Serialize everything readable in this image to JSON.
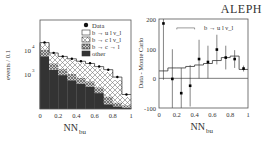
{
  "header": {
    "experiment_label": "ALEPH"
  },
  "chart_data": [
    {
      "type": "bar",
      "subtype": "stacked-histogram-log",
      "title": "",
      "xlabel": "NN_bu",
      "xlabel_main": "NN",
      "xlabel_sub": "bu",
      "ylabel": "events / 0.1",
      "yscale": "log",
      "xlim": [
        0,
        1
      ],
      "ylim": [
        35,
        180000
      ],
      "x_ticks": [
        "0",
        "0.2",
        "0.4",
        "0.6",
        "0.8",
        "1"
      ],
      "y_ticks": [
        {
          "label": "10",
          "exp": "4",
          "value": 10000
        },
        {
          "label": "10",
          "exp": "3",
          "value": 1000
        }
      ],
      "categories": [
        "0.0-0.1",
        "0.1-0.2",
        "0.2-0.3",
        "0.3-0.4",
        "0.4-0.5",
        "0.5-0.6",
        "0.6-0.7",
        "0.7-0.8",
        "0.8-0.9",
        "0.9-1.0"
      ],
      "series": [
        {
          "name": "other",
          "pattern": "solid-dark",
          "values": [
            5500,
            1500,
            900,
            550,
            400,
            300,
            160,
            55,
            45,
            40
          ]
        },
        {
          "name": "b → c → l",
          "pattern": "dense-crosshatch",
          "values": [
            5000,
            1300,
            700,
            450,
            300,
            200,
            120,
            60,
            20,
            10
          ]
        },
        {
          "name": "b → c l ν_l",
          "pattern": "crosshatch",
          "values": [
            8500,
            4200,
            3300,
            2900,
            2300,
            1900,
            1450,
            1100,
            500,
            60
          ]
        },
        {
          "name": "b → u l ν_l",
          "pattern": "white",
          "values": [
            1500,
            500,
            500,
            400,
            400,
            350,
            300,
            300,
            180,
            30
          ]
        }
      ],
      "data_points": {
        "name": "Data",
        "values": [
          20500,
          7600,
          5400,
          4300,
          3400,
          2800,
          2050,
          1500,
          750,
          140
        ]
      },
      "legend": [
        "Data",
        "b → u l ν_l",
        "b → c l ν_l",
        "b → c → l",
        "other"
      ],
      "legend_position": "upper right",
      "grid": false
    },
    {
      "type": "scatter",
      "subtype": "data-minus-mc-with-errorbars",
      "title": "",
      "xlabel": "NN_bu",
      "xlabel_main": "NN",
      "xlabel_sub": "bu",
      "ylabel": "Data - Monte Carlo",
      "xlim": [
        0,
        1
      ],
      "ylim": [
        -100,
        200
      ],
      "x_ticks": [
        "0",
        "0.2",
        "0.4",
        "0.6",
        "0.8",
        "1"
      ],
      "y_ticks": [
        "-100",
        "0",
        "100",
        "200"
      ],
      "x": [
        0.05,
        0.15,
        0.25,
        0.35,
        0.45,
        0.55,
        0.65,
        0.75,
        0.85,
        0.95
      ],
      "series": [
        {
          "name": "Data - MC",
          "values": [
            185,
            -2,
            -50,
            -25,
            65,
            55,
            97,
            70,
            65,
            33
          ],
          "errors": [
            190,
            100,
            85,
            70,
            65,
            55,
            50,
            40,
            30,
            10
          ]
        },
        {
          "name": "b → u l ν_l (MC)",
          "type": "step",
          "values": [
            25,
            35,
            35,
            40,
            45,
            50,
            60,
            70,
            75,
            30
          ]
        }
      ],
      "annotation": {
        "text": "b → u l ν_l",
        "bracket_x": [
          0.2,
          0.4
        ],
        "bracket_y": 170
      },
      "reference_line_y": 0,
      "grid": false
    }
  ]
}
